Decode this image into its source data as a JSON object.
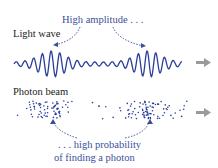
{
  "top_annotation": "High amplitude . . .",
  "wave_label": "Light wave",
  "beam_label": "Photon beam",
  "bottom_annotation_line1": ". . . high probability",
  "bottom_annotation_line2": "of finding a photon",
  "colors": {
    "wave": "#2b3f9a",
    "annotation": "#3a4f9a",
    "arrow": "#9a9a9a",
    "text": "#222222"
  }
}
